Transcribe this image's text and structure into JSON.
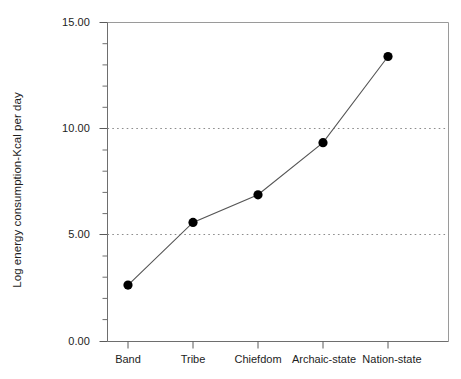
{
  "chart_data": {
    "type": "line",
    "title": "",
    "subtitle": "",
    "xlabel": "",
    "ylabel": "Log energy consumption-Kcal per day",
    "categories": [
      "Band",
      "Tribe",
      "Chiefdom",
      "Archaic-state",
      "Nation-state"
    ],
    "values": [
      2.65,
      5.6,
      6.9,
      9.35,
      13.4
    ],
    "series": [
      {
        "name": "Log energy consumption-Kcal per day",
        "values": [
          2.65,
          5.6,
          6.9,
          9.35,
          13.4
        ]
      }
    ],
    "ylim": [
      0.0,
      15.0
    ],
    "ytick_labels": [
      "0.00",
      "5.00",
      "10.00",
      "15.00"
    ],
    "ytick_values": [
      0.0,
      5.0,
      10.0,
      15.0
    ],
    "yminor_step": 1.0,
    "grid": "horizontal-dotted-at-5-and-10",
    "gridlines_at": [
      5.0,
      10.0
    ],
    "legend": "none",
    "legend_position": "none",
    "marker": "filled-circle",
    "marker_color": "#000000",
    "line_color": "#4d4d4d",
    "frame_color": "#808080",
    "axis_color": "#666666",
    "background": "#ffffff"
  },
  "axes": {
    "y": {
      "ticks": [
        {
          "label": "15.00",
          "value": 15.0
        },
        {
          "label": "10.00",
          "value": 10.0
        },
        {
          "label": "5.00",
          "value": 5.0
        },
        {
          "label": "0.00",
          "value": 0.0
        }
      ],
      "title": "Log energy consumption-Kcal per day"
    },
    "x": {
      "ticks": [
        {
          "label": "Band"
        },
        {
          "label": "Tribe"
        },
        {
          "label": "Chiefdom"
        },
        {
          "label": "Archaic-state"
        },
        {
          "label": "Nation-state"
        }
      ],
      "title": ""
    }
  }
}
